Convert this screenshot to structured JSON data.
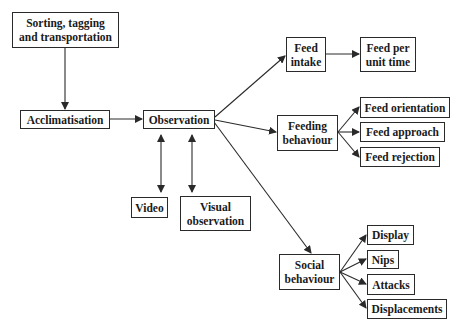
{
  "diagram": {
    "nodes": {
      "sorting": {
        "label": "Sorting, tagging\nand transportation"
      },
      "acclimatisation": {
        "label": "Acclimatisation"
      },
      "observation": {
        "label": "Observation"
      },
      "video": {
        "label": "Video"
      },
      "visual_observation": {
        "label": "Visual\nobservation"
      },
      "feed_intake": {
        "label": "Feed\nintake"
      },
      "feed_per_unit_time": {
        "label": "Feed per\nunit time"
      },
      "feeding_behaviour": {
        "label": "Feeding\nbehaviour"
      },
      "feed_orientation": {
        "label": "Feed orientation"
      },
      "feed_approach": {
        "label": "Feed approach"
      },
      "feed_rejection": {
        "label": "Feed rejection"
      },
      "social_behaviour": {
        "label": "Social\nbehaviour"
      },
      "display": {
        "label": "Display"
      },
      "nips": {
        "label": "Nips"
      },
      "attacks": {
        "label": "Attacks"
      },
      "displacements": {
        "label": "Displacements"
      }
    },
    "edges": [
      {
        "from": "sorting",
        "to": "acclimatisation",
        "type": "arrow"
      },
      {
        "from": "acclimatisation",
        "to": "observation",
        "type": "arrow"
      },
      {
        "from": "observation",
        "to": "video",
        "type": "double-arrow"
      },
      {
        "from": "observation",
        "to": "visual_observation",
        "type": "double-arrow"
      },
      {
        "from": "observation",
        "to": "feed_intake",
        "type": "arrow"
      },
      {
        "from": "observation",
        "to": "feeding_behaviour",
        "type": "arrow"
      },
      {
        "from": "observation",
        "to": "social_behaviour",
        "type": "arrow"
      },
      {
        "from": "feed_intake",
        "to": "feed_per_unit_time",
        "type": "arrow"
      },
      {
        "from": "feeding_behaviour",
        "to": "feed_orientation",
        "type": "arrow"
      },
      {
        "from": "feeding_behaviour",
        "to": "feed_approach",
        "type": "arrow"
      },
      {
        "from": "feeding_behaviour",
        "to": "feed_rejection",
        "type": "arrow"
      },
      {
        "from": "social_behaviour",
        "to": "display",
        "type": "arrow"
      },
      {
        "from": "social_behaviour",
        "to": "nips",
        "type": "arrow"
      },
      {
        "from": "social_behaviour",
        "to": "attacks",
        "type": "arrow"
      },
      {
        "from": "social_behaviour",
        "to": "displacements",
        "type": "arrow"
      }
    ],
    "colors": {
      "line": "#2a2a2a",
      "text": "#1a1a1a",
      "background": "#ffffff"
    }
  }
}
